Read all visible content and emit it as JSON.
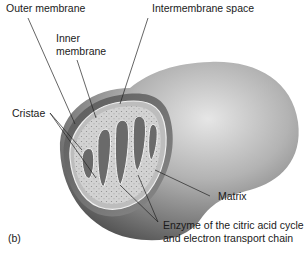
{
  "figure": {
    "panel_label": "(b)",
    "labels": {
      "outer_membrane": "Outer membrane",
      "intermembrane_space": "Intermembrane space",
      "inner_membrane_line1": "Inner",
      "inner_membrane_line2": "membrane",
      "cristae": "Cristae",
      "matrix": "Matrix",
      "enzyme_line1": "Enzyme of the citric acid cycle",
      "enzyme_line2": "and electron transport chain"
    },
    "colors": {
      "background": "#ffffff",
      "outer_surface_light": "#d9d9d9",
      "outer_surface_dark": "#6e6e6e",
      "intermembrane_dark": "#4a4a4a",
      "matrix_fill": "#cfcfcf",
      "leader_line": "#222222"
    }
  }
}
